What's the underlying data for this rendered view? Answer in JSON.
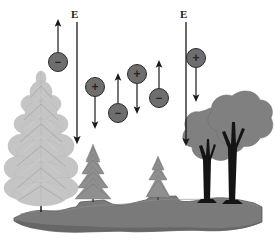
{
  "diagram": {
    "background_color": "#ffffff",
    "width": 275,
    "height": 249
  },
  "field_arrows": [
    {
      "id": "field-arrow-left",
      "label": "E",
      "direction": "down",
      "x": 77,
      "y_start": 22,
      "y_end": 140,
      "color": "#1a1a1a",
      "label_x": 71,
      "label_y": 9
    },
    {
      "id": "field-arrow-right",
      "label": "E",
      "direction": "down",
      "x": 186,
      "y_start": 22,
      "y_end": 142,
      "color": "#1a1a1a",
      "label_x": 180,
      "label_y": 9
    }
  ],
  "particles": [
    {
      "id": "particle-1",
      "charge": "-",
      "sign_glyph": "−",
      "cx": 58,
      "cy": 62,
      "r": 9.5,
      "fill": "#6e6e6e",
      "stroke": "#2b2b2b",
      "motion": "up",
      "arrow_x": 58,
      "arrow_from": 52,
      "arrow_to": 22,
      "arrow_color": "#1a1a1a"
    },
    {
      "id": "particle-2",
      "charge": "+",
      "sign_glyph": "+",
      "cx": 95,
      "cy": 87,
      "r": 9.5,
      "fill": "#6e6e6e",
      "stroke": "#2b2b2b",
      "motion": "down",
      "arrow_x": 95,
      "arrow_from": 96,
      "arrow_to": 125,
      "arrow_color": "#1a1a1a"
    },
    {
      "id": "particle-3",
      "charge": "-",
      "sign_glyph": "−",
      "cx": 118,
      "cy": 113,
      "r": 9.5,
      "fill": "#6e6e6e",
      "stroke": "#2b2b2b",
      "motion": "up",
      "arrow_x": 118,
      "arrow_from": 103,
      "arrow_to": 77,
      "arrow_color": "#1a1a1a"
    },
    {
      "id": "particle-4",
      "charge": "+",
      "sign_glyph": "+",
      "cx": 137,
      "cy": 74,
      "r": 9.5,
      "fill": "#6e6e6e",
      "stroke": "#2b2b2b",
      "motion": "down",
      "arrow_x": 137,
      "arrow_from": 84,
      "arrow_to": 110,
      "arrow_color": "#1a1a1a"
    },
    {
      "id": "particle-5",
      "charge": "-",
      "sign_glyph": "−",
      "cx": 159,
      "cy": 98,
      "r": 9.5,
      "fill": "#6e6e6e",
      "stroke": "#2b2b2b",
      "motion": "up",
      "arrow_x": 159,
      "arrow_from": 88,
      "arrow_to": 64,
      "arrow_color": "#1a1a1a"
    },
    {
      "id": "particle-6",
      "charge": "+",
      "sign_glyph": "+",
      "cx": 196,
      "cy": 58,
      "r": 9.5,
      "fill": "#6e6e6e",
      "stroke": "#2b2b2b",
      "motion": "down",
      "arrow_x": 196,
      "arrow_from": 68,
      "arrow_to": 98,
      "arrow_color": "#1a1a1a"
    }
  ],
  "vegetation": {
    "large_conifer": {
      "id": "large-conifer-tree",
      "type": "conifer",
      "color": "#c9c9c9",
      "trunk_color": "#1a1a1a",
      "base_x": 41,
      "base_y": 212,
      "height": 145
    },
    "small_conifers": [
      {
        "id": "small-conifer-left",
        "type": "conifer",
        "color": "#8f8f8f",
        "trunk_color": "#3a3a3a",
        "base_x": 93,
        "base_y": 200,
        "height": 58
      },
      {
        "id": "small-conifer-right",
        "type": "conifer",
        "color": "#8f8f8f",
        "trunk_color": "#3a3a3a",
        "base_x": 158,
        "base_y": 198,
        "height": 44
      }
    ],
    "deciduous_trees": [
      {
        "id": "deciduous-tree-left",
        "type": "deciduous",
        "canopy_color": "#808080",
        "trunk_color": "#141414",
        "base_x": 206,
        "base_y": 202,
        "height": 95
      },
      {
        "id": "deciduous-tree-right",
        "type": "deciduous",
        "canopy_color": "#808080",
        "trunk_color": "#141414",
        "base_x": 231,
        "base_y": 203,
        "height": 110
      }
    ]
  },
  "ground": {
    "id": "ground-terrain",
    "fill": "#7a7a7a",
    "shade_fill": "#6b6b6b",
    "stroke": "#4a4a4a",
    "top_y": 196,
    "bottom_y": 232
  }
}
